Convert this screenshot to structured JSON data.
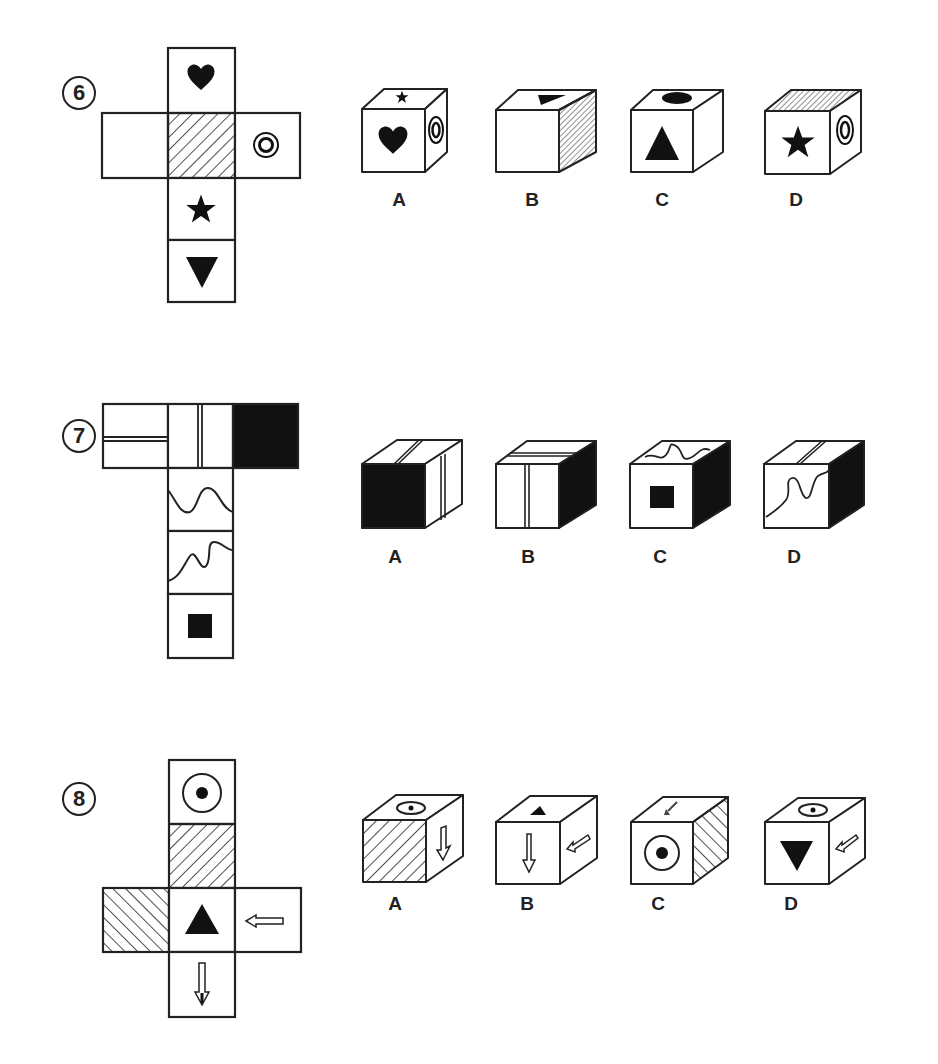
{
  "questions": [
    {
      "number": "6",
      "net": {
        "layout": "cross",
        "faces": [
          {
            "position": "top",
            "symbol": "heart"
          },
          {
            "position": "left",
            "symbol": "blank"
          },
          {
            "position": "center",
            "symbol": "hatched-diagonal"
          },
          {
            "position": "right",
            "symbol": "double-circle"
          },
          {
            "position": "below-center",
            "symbol": "star"
          },
          {
            "position": "bottom",
            "symbol": "down-triangle"
          }
        ]
      },
      "options": [
        {
          "label": "A",
          "front": "heart",
          "top": "star",
          "side": "double-circle"
        },
        {
          "label": "B",
          "front": "blank",
          "top": "down-triangle",
          "side": "hatched"
        },
        {
          "label": "C",
          "front": "up-triangle",
          "top": "heart",
          "side": "blank"
        },
        {
          "label": "D",
          "front": "star",
          "top": "hatched",
          "side": "double-circle"
        }
      ]
    },
    {
      "number": "7",
      "net": {
        "layout": "T",
        "faces": [
          {
            "position": "top-left",
            "symbol": "horizontal-double-line"
          },
          {
            "position": "top-center",
            "symbol": "vertical-double-line"
          },
          {
            "position": "top-right",
            "symbol": "solid-black"
          },
          {
            "position": "middle-1",
            "symbol": "wave"
          },
          {
            "position": "middle-2",
            "symbol": "wave-diagonal"
          },
          {
            "position": "bottom",
            "symbol": "small-black-square"
          }
        ]
      },
      "options": [
        {
          "label": "A",
          "front": "solid-black",
          "top": "double-line",
          "side": "vertical-double-line"
        },
        {
          "label": "B",
          "front": "vertical-double-line",
          "top": "horizontal-double-line",
          "side": "solid-black"
        },
        {
          "label": "C",
          "front": "small-black-square",
          "top": "wave",
          "side": "solid-black"
        },
        {
          "label": "D",
          "front": "wave-diagonal",
          "top": "double-line",
          "side": "solid-black"
        }
      ]
    },
    {
      "number": "8",
      "net": {
        "layout": "cross",
        "faces": [
          {
            "position": "top",
            "symbol": "dot-circle"
          },
          {
            "position": "second",
            "symbol": "hatched-forward"
          },
          {
            "position": "left",
            "symbol": "hatched-backward"
          },
          {
            "position": "center",
            "symbol": "up-triangle"
          },
          {
            "position": "right",
            "symbol": "left-arrow"
          },
          {
            "position": "bottom",
            "symbol": "down-arrow"
          }
        ]
      },
      "options": [
        {
          "label": "A",
          "front": "hatched-forward",
          "top": "dot-circle",
          "side": "down-arrow"
        },
        {
          "label": "B",
          "front": "down-arrow",
          "top": "up-triangle",
          "side": "left-arrow"
        },
        {
          "label": "C",
          "front": "dot-circle",
          "top": "down-arrow",
          "side": "hatched-backward"
        },
        {
          "label": "D",
          "front": "down-triangle",
          "top": "dot-circle",
          "side": "left-arrow"
        }
      ]
    }
  ]
}
